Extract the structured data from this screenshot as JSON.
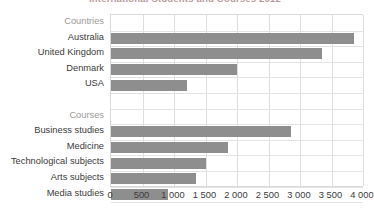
{
  "chart_data": {
    "type": "bar",
    "orientation": "horizontal",
    "title": "International Students and Courses 2012",
    "xlabel": "",
    "ylabel": "",
    "xlim": [
      0,
      4000
    ],
    "xticks": [
      0,
      500,
      1000,
      1500,
      2000,
      2500,
      3000,
      3500,
      4000
    ],
    "xtick_labels": [
      "0",
      "500",
      "1 000",
      "1 500",
      "2 000",
      "2 500",
      "3 000",
      "3 500",
      "4 000"
    ],
    "grid": true,
    "legend": "none",
    "bar_color": "#8e8e8e",
    "group_label_color": "#9a9a9a",
    "rows": [
      {
        "label": "Countries",
        "value": null,
        "kind": "group"
      },
      {
        "label": "Australia",
        "value": 3850,
        "kind": "bar"
      },
      {
        "label": "United Kingdom",
        "value": 3350,
        "kind": "bar"
      },
      {
        "label": "Denmark",
        "value": 2000,
        "kind": "bar"
      },
      {
        "label": "USA",
        "value": 1200,
        "kind": "bar"
      },
      {
        "label": "",
        "value": null,
        "kind": "blank"
      },
      {
        "label": "Courses",
        "value": null,
        "kind": "group"
      },
      {
        "label": "Business studies",
        "value": 2850,
        "kind": "bar"
      },
      {
        "label": "Medicine",
        "value": 1850,
        "kind": "bar"
      },
      {
        "label": "Technological subjects",
        "value": 1500,
        "kind": "bar"
      },
      {
        "label": "Arts subjects",
        "value": 1350,
        "kind": "bar"
      },
      {
        "label": "Media studies",
        "value": 900,
        "kind": "bar"
      }
    ],
    "categories": [
      "Australia",
      "United Kingdom",
      "Denmark",
      "USA",
      "Business studies",
      "Medicine",
      "Technological subjects",
      "Arts subjects",
      "Media studies"
    ],
    "values": [
      3850,
      3350,
      2000,
      1200,
      2850,
      1850,
      1500,
      1350,
      900
    ]
  }
}
